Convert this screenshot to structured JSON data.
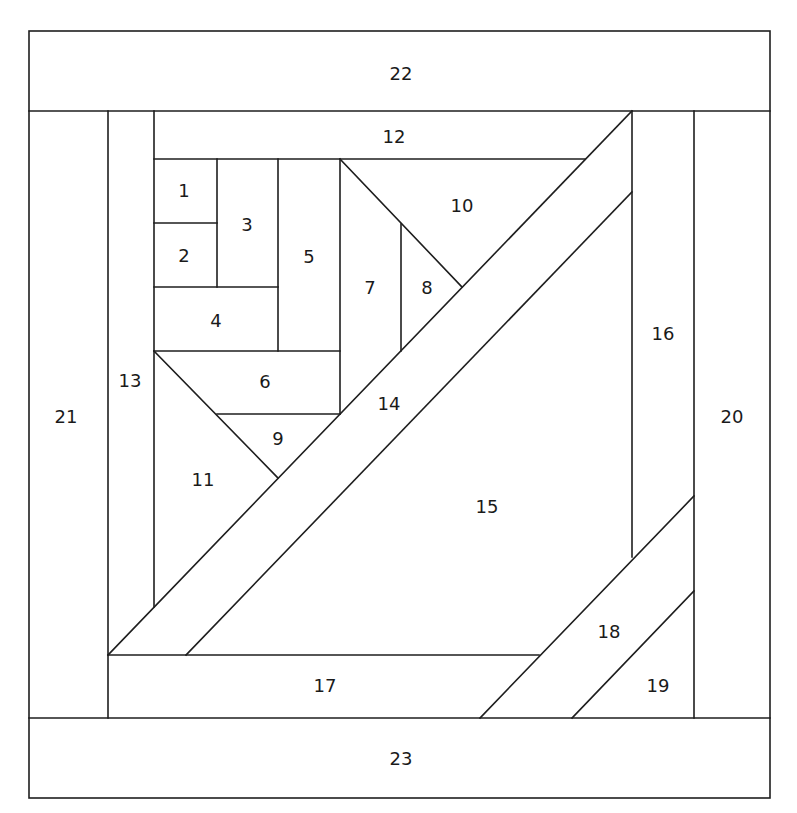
{
  "diagram": {
    "type": "paper-piecing quilt block pattern",
    "line_color": "#1e1e1e",
    "background": "#ffffff",
    "pieces": [
      {
        "id": "1",
        "label": "1",
        "x": 184,
        "y": 190
      },
      {
        "id": "2",
        "label": "2",
        "x": 184,
        "y": 255
      },
      {
        "id": "3",
        "label": "3",
        "x": 247,
        "y": 224
      },
      {
        "id": "4",
        "label": "4",
        "x": 216,
        "y": 320
      },
      {
        "id": "5",
        "label": "5",
        "x": 309,
        "y": 256
      },
      {
        "id": "6",
        "label": "6",
        "x": 265,
        "y": 381
      },
      {
        "id": "7",
        "label": "7",
        "x": 370,
        "y": 287
      },
      {
        "id": "8",
        "label": "8",
        "x": 427,
        "y": 287
      },
      {
        "id": "9",
        "label": "9",
        "x": 278,
        "y": 438
      },
      {
        "id": "10",
        "label": "10",
        "x": 462,
        "y": 205
      },
      {
        "id": "11",
        "label": "11",
        "x": 203,
        "y": 479
      },
      {
        "id": "12",
        "label": "12",
        "x": 394,
        "y": 136
      },
      {
        "id": "13",
        "label": "13",
        "x": 130,
        "y": 380
      },
      {
        "id": "14",
        "label": "14",
        "x": 389,
        "y": 403
      },
      {
        "id": "15",
        "label": "15",
        "x": 487,
        "y": 506
      },
      {
        "id": "16",
        "label": "16",
        "x": 663,
        "y": 333
      },
      {
        "id": "17",
        "label": "17",
        "x": 325,
        "y": 685
      },
      {
        "id": "18",
        "label": "18",
        "x": 609,
        "y": 631
      },
      {
        "id": "19",
        "label": "19",
        "x": 658,
        "y": 685
      },
      {
        "id": "20",
        "label": "20",
        "x": 732,
        "y": 416
      },
      {
        "id": "21",
        "label": "21",
        "x": 66,
        "y": 416
      },
      {
        "id": "22",
        "label": "22",
        "x": 401,
        "y": 73
      },
      {
        "id": "23",
        "label": "23",
        "x": 401,
        "y": 758
      }
    ]
  }
}
